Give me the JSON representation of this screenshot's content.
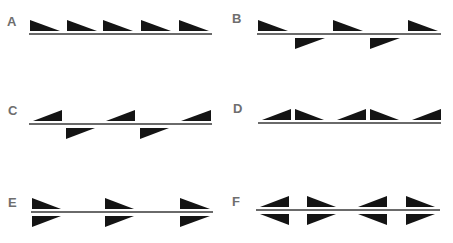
{
  "figure": {
    "colors": {
      "triangle": "#141414",
      "line": "#6a6a6a",
      "label": "#6e6e6e"
    },
    "panels": [
      {
        "label": "A",
        "label_pos": [
          7,
          14
        ],
        "line": {
          "x1": 29,
          "x2": 212,
          "y": 34
        },
        "triangles": [
          {
            "x": 30,
            "w": 30,
            "side": "up",
            "vertical": "left"
          },
          {
            "x": 67,
            "w": 30,
            "side": "up",
            "vertical": "left"
          },
          {
            "x": 103,
            "w": 30,
            "side": "up",
            "vertical": "left"
          },
          {
            "x": 141,
            "w": 30,
            "side": "up",
            "vertical": "left"
          },
          {
            "x": 179,
            "w": 30,
            "side": "up",
            "vertical": "left"
          }
        ]
      },
      {
        "label": "B",
        "label_pos": [
          232,
          11
        ],
        "line": {
          "x1": 257,
          "x2": 441,
          "y": 34
        },
        "triangles": [
          {
            "x": 258,
            "w": 30,
            "side": "up",
            "vertical": "left"
          },
          {
            "x": 333,
            "w": 30,
            "side": "up",
            "vertical": "left"
          },
          {
            "x": 408,
            "w": 30,
            "side": "up",
            "vertical": "left"
          },
          {
            "x": 295,
            "w": 30,
            "side": "down",
            "vertical": "left"
          },
          {
            "x": 370,
            "w": 30,
            "side": "down",
            "vertical": "left"
          }
        ]
      },
      {
        "label": "C",
        "label_pos": [
          8,
          103
        ],
        "line": {
          "x1": 29,
          "x2": 212,
          "y": 124
        },
        "triangles": [
          {
            "x": 33,
            "w": 29,
            "side": "up",
            "vertical": "right"
          },
          {
            "x": 106,
            "w": 29,
            "side": "up",
            "vertical": "right"
          },
          {
            "x": 181,
            "w": 30,
            "side": "up",
            "vertical": "right"
          },
          {
            "x": 66,
            "w": 29,
            "side": "down",
            "vertical": "left"
          },
          {
            "x": 140,
            "w": 29,
            "side": "down",
            "vertical": "left"
          }
        ]
      },
      {
        "label": "D",
        "label_pos": [
          233,
          101
        ],
        "line": {
          "x1": 258,
          "x2": 441,
          "y": 123
        },
        "triangles": [
          {
            "x": 262,
            "w": 29,
            "side": "up",
            "vertical": "right"
          },
          {
            "x": 295,
            "w": 29,
            "side": "up",
            "vertical": "left"
          },
          {
            "x": 337,
            "w": 29,
            "side": "up",
            "vertical": "right"
          },
          {
            "x": 370,
            "w": 29,
            "side": "up",
            "vertical": "left"
          },
          {
            "x": 412,
            "w": 29,
            "side": "up",
            "vertical": "right"
          }
        ]
      },
      {
        "label": "E",
        "label_pos": [
          8,
          195
        ],
        "line": {
          "x1": 31,
          "x2": 213,
          "y": 212
        },
        "triangles": [
          {
            "x": 32,
            "w": 29,
            "side": "up",
            "vertical": "left"
          },
          {
            "x": 105,
            "w": 29,
            "side": "up",
            "vertical": "left"
          },
          {
            "x": 180,
            "w": 30,
            "side": "up",
            "vertical": "left"
          },
          {
            "x": 32,
            "w": 29,
            "side": "down",
            "vertical": "left"
          },
          {
            "x": 105,
            "w": 29,
            "side": "down",
            "vertical": "left"
          },
          {
            "x": 180,
            "w": 30,
            "side": "down",
            "vertical": "left"
          }
        ]
      },
      {
        "label": "F",
        "label_pos": [
          232,
          194
        ],
        "line": {
          "x1": 256,
          "x2": 440,
          "y": 210
        },
        "triangles": [
          {
            "x": 260,
            "w": 29,
            "side": "up",
            "vertical": "right"
          },
          {
            "x": 307,
            "w": 29,
            "side": "up",
            "vertical": "left"
          },
          {
            "x": 358,
            "w": 29,
            "side": "up",
            "vertical": "right"
          },
          {
            "x": 406,
            "w": 29,
            "side": "up",
            "vertical": "left"
          },
          {
            "x": 260,
            "w": 29,
            "side": "down",
            "vertical": "right"
          },
          {
            "x": 307,
            "w": 29,
            "side": "down",
            "vertical": "left"
          },
          {
            "x": 358,
            "w": 29,
            "side": "down",
            "vertical": "right"
          },
          {
            "x": 406,
            "w": 29,
            "side": "down",
            "vertical": "left"
          }
        ]
      }
    ]
  }
}
